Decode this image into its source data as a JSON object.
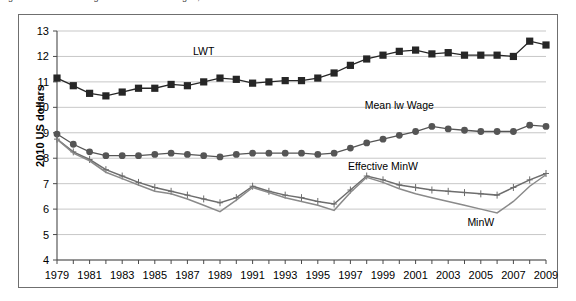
{
  "figure": {
    "caption_clipped": "Figure 1.  Trends in wages and minimum wages, 1979-2009",
    "y_axis_title": "2010 US dollars"
  },
  "chart_data": {
    "type": "line",
    "title": "",
    "xlabel": "",
    "ylabel": "2010 US dollars",
    "xlim": [
      1979,
      2009
    ],
    "ylim": [
      4,
      13
    ],
    "yticks": [
      4,
      5,
      6,
      7,
      8,
      9,
      10,
      11,
      12,
      13
    ],
    "xticks": [
      1979,
      1981,
      1983,
      1985,
      1987,
      1989,
      1991,
      1993,
      1995,
      1997,
      1999,
      2001,
      2003,
      2005,
      2007,
      2009
    ],
    "xtick_labels": [
      "1979",
      "1981",
      "1983",
      "1985",
      "1987",
      "1989",
      "1991",
      "1993",
      "1995",
      "1997",
      "1999",
      "2001",
      "2003",
      "2005",
      "2007",
      "2009"
    ],
    "grid": "horizontal",
    "legend_position": "inline-annotations",
    "x": [
      1979,
      1980,
      1981,
      1982,
      1983,
      1984,
      1985,
      1986,
      1987,
      1988,
      1989,
      1990,
      1991,
      1992,
      1993,
      1994,
      1995,
      1996,
      1997,
      1998,
      1999,
      2000,
      2001,
      2002,
      2003,
      2004,
      2005,
      2006,
      2007,
      2008,
      2009
    ],
    "series": [
      {
        "name": "LWT",
        "marker": "square",
        "color": "#262626",
        "label_x": 1988,
        "label_y": 12.05,
        "values": [
          11.15,
          10.85,
          10.55,
          10.45,
          10.6,
          10.75,
          10.75,
          10.9,
          10.85,
          11.0,
          11.15,
          11.1,
          10.95,
          11.0,
          11.05,
          11.05,
          11.15,
          11.35,
          11.65,
          11.9,
          12.05,
          12.2,
          12.25,
          12.1,
          12.15,
          12.05,
          12.05,
          12.05,
          12.0,
          12.6,
          12.45
        ]
      },
      {
        "name": "Mean lw Wage",
        "marker": "circle",
        "color": "#555555",
        "label_x": 2000,
        "label_y": 9.95,
        "values": [
          8.95,
          8.55,
          8.25,
          8.1,
          8.1,
          8.1,
          8.15,
          8.2,
          8.15,
          8.1,
          8.05,
          8.15,
          8.2,
          8.2,
          8.2,
          8.2,
          8.15,
          8.2,
          8.4,
          8.6,
          8.75,
          8.9,
          9.05,
          9.25,
          9.15,
          9.1,
          9.05,
          9.05,
          9.05,
          9.3,
          9.25
        ]
      },
      {
        "name": "Effective MinW",
        "marker": "cross",
        "color": "#6d6d6d",
        "label_x": 1999,
        "label_y": 7.55,
        "values": [
          8.75,
          8.25,
          7.95,
          7.55,
          7.3,
          7.05,
          6.85,
          6.7,
          6.55,
          6.4,
          6.25,
          6.45,
          6.9,
          6.7,
          6.55,
          6.45,
          6.3,
          6.2,
          6.75,
          7.3,
          7.15,
          6.95,
          6.85,
          6.75,
          6.7,
          6.65,
          6.6,
          6.55,
          6.85,
          7.15,
          7.4
        ]
      },
      {
        "name": "MinW",
        "marker": "line",
        "color": "#8a8a8a",
        "label_x": 2005,
        "label_y": 5.35,
        "values": [
          8.75,
          8.2,
          7.9,
          7.45,
          7.2,
          6.95,
          6.7,
          6.6,
          6.4,
          6.15,
          5.9,
          6.35,
          6.85,
          6.65,
          6.45,
          6.3,
          6.15,
          5.95,
          6.65,
          7.25,
          7.05,
          6.8,
          6.6,
          6.45,
          6.3,
          6.15,
          6.0,
          5.85,
          6.3,
          6.9,
          7.35
        ]
      }
    ]
  }
}
